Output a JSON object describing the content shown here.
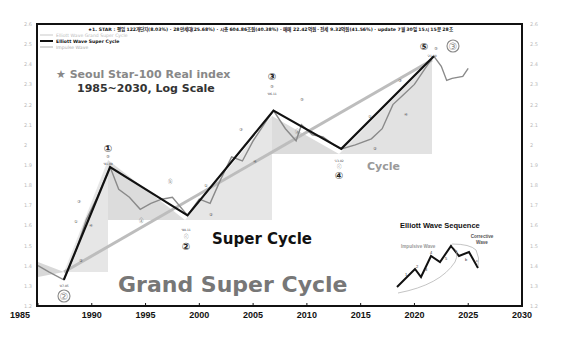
{
  "chart_data": {
    "type": "line",
    "title": "★ Seoul Star-100 Real index",
    "subtitle": "1985~2030, Log Scale",
    "header": "★1. STAR : 평입 122개단지(8.03%) · 28만세대(25.68%) · 시총 604.86조원(40.38%) · 매매 22.42억원 · 전세 9.32억원(41.56%) · update 7월 30일 15시 15분 28초",
    "xlabel": "",
    "ylabel": "",
    "xlim": [
      1985,
      2030
    ],
    "ylim": [
      1.2,
      2.6
    ],
    "x_ticks": [
      "1985",
      "1990",
      "1995",
      "2000",
      "2005",
      "2010",
      "2015",
      "2020",
      "2025",
      "2030"
    ],
    "y_ticks": [
      "2.6",
      "2.5",
      "2.4",
      "2.3",
      "2.2",
      "2.1",
      "2",
      "1.9",
      "1.8",
      "1.7",
      "1.6",
      "1.5",
      "1.4",
      "1.3",
      "1.2"
    ],
    "grid": false,
    "legend_position": "top-left",
    "legend": [
      {
        "name": "Elliott Wave Grand Super Cycle",
        "color": "#bbbbbb"
      },
      {
        "name": "Elliott Wave Super Cycle",
        "color": "#111111"
      },
      {
        "name": "Impulse Wave",
        "color": "#999999"
      }
    ],
    "series": [
      {
        "name": "Elliott Wave Grand Super Cycle",
        "x": [
          1987.4,
          2021.8
        ],
        "y": [
          1.33,
          2.44
        ]
      },
      {
        "name": "Elliott Wave Super Cycle",
        "x": [
          1987.4,
          1991.7,
          1998.9,
          2006.9,
          2013.2,
          2021.8
        ],
        "y": [
          1.33,
          1.89,
          1.65,
          2.17,
          1.98,
          2.44
        ]
      },
      {
        "name": "Impulse Wave",
        "x": [
          1985,
          1986,
          1987.4,
          1988.5,
          1989.5,
          1990.5,
          1991.7,
          1992.5,
          1993.5,
          1994.5,
          1995.5,
          1996.5,
          1997.5,
          1998.9,
          2000,
          2001,
          2002,
          2003,
          2004,
          2005,
          2006,
          2006.9,
          2008,
          2009,
          2009.5,
          2010.5,
          2011.5,
          2012.5,
          2013.2,
          2014.5,
          2016,
          2017,
          2018,
          2019,
          2020,
          2021,
          2021.8,
          2022.5,
          2023,
          2023.5,
          2024.5,
          2025
        ],
        "y": [
          1.4,
          1.37,
          1.33,
          1.47,
          1.63,
          1.74,
          1.89,
          1.78,
          1.74,
          1.68,
          1.71,
          1.73,
          1.74,
          1.65,
          1.73,
          1.71,
          1.83,
          1.94,
          1.92,
          2.02,
          2.1,
          2.17,
          2.08,
          2.02,
          2.1,
          2.05,
          2.04,
          2.0,
          1.98,
          2.0,
          2.03,
          2.08,
          2.2,
          2.25,
          2.3,
          2.38,
          2.44,
          2.39,
          2.32,
          2.33,
          2.34,
          2.38
        ]
      }
    ],
    "annotations": [
      {
        "label": "②",
        "date": "'87-05",
        "x": 1987.4,
        "y": 1.33,
        "degree": "grand"
      },
      {
        "label": "①",
        "date": "'91-09",
        "x": 1991.7,
        "y": 1.89,
        "degree": "super"
      },
      {
        "label": "②",
        "date": "'98-11",
        "x": 1998.9,
        "y": 1.65,
        "degree": "super"
      },
      {
        "label": "③",
        "date": "'06-11",
        "x": 2006.9,
        "y": 2.17,
        "degree": "super"
      },
      {
        "label": "④",
        "date": "'13-02",
        "x": 2013.2,
        "y": 1.98,
        "degree": "super"
      },
      {
        "label": "⑤",
        "date": "'21-10",
        "x": 2021.8,
        "y": 2.44,
        "degree": "super"
      },
      {
        "label": "③",
        "date": "",
        "x": 2021.8,
        "y": 2.44,
        "degree": "grand"
      }
    ],
    "region_labels": [
      "Grand Super Cycle",
      "Super Cycle",
      "Cycle"
    ]
  },
  "inset": {
    "title": "Elliott Wave Sequence",
    "impulsive_label": "Impulsive Wave",
    "corrective_label_1": "Corrective",
    "corrective_label_2": "Wave",
    "numbers": [
      "1",
      "2",
      "3",
      "4",
      "5",
      "a",
      "b",
      "c"
    ]
  },
  "labels": {
    "circle_1": "①",
    "circle_2": "②",
    "circle_3": "③",
    "circle_4": "④",
    "circle_5": "⑤",
    "date_8705": "'87-05",
    "date_9109": "'91-09",
    "date_9811": "'98-11",
    "date_0611": "'06-11",
    "date_1302": "'13-02",
    "date_2110": "'21-10",
    "sub_5": "⑤",
    "sub_a": "ⓐ",
    "sub_b": "ⓑ",
    "sub_c": "ⓒ",
    "sub_1": "①",
    "sub_2": "②",
    "sub_3": "③",
    "sub_4": "④"
  }
}
